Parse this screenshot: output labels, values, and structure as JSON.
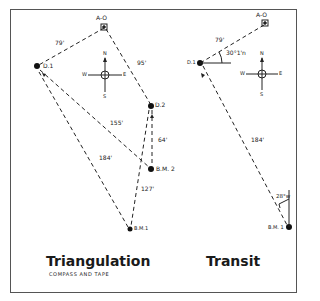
{
  "panels": {
    "triangulation": {
      "title": "Triangulation",
      "subtitle": "COMPASS AND TAPE",
      "points": {
        "ao": "A-O",
        "d1": "D.1",
        "d2": "D.2",
        "bm2": "B.M. 2",
        "bm1": "B.M.1"
      },
      "distances": {
        "ao_d1": "79'",
        "ao_d2": "95'",
        "d1_bm2": "155'",
        "d2_bm2": "64'",
        "d1_bm1": "184'",
        "bm2_bm1": "127'"
      },
      "compass": {
        "n": "N",
        "s": "S",
        "e": "E",
        "w": "W"
      }
    },
    "transit": {
      "title": "Transit",
      "points": {
        "ao": "A-O",
        "d1": "D.1",
        "bm1": "B.M. 1"
      },
      "distances": {
        "ao_d1": "79'",
        "d1_bm1": "184'"
      },
      "angles": {
        "at_d1": "30°1'n",
        "at_bm1": "28°w"
      },
      "compass": {
        "n": "N",
        "s": "S",
        "e": "E",
        "w": "W"
      }
    }
  }
}
